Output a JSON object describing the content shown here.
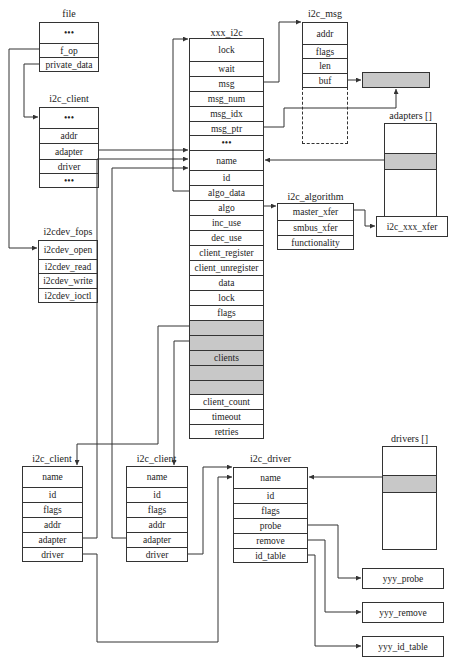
{
  "structs": {
    "file": {
      "title": "file",
      "fields": [
        "•••",
        "f_op",
        "private_data"
      ]
    },
    "i2c_client_top": {
      "title": "i2c_client",
      "fields": [
        "•••",
        "addr",
        "adapter",
        "driver",
        "•••"
      ]
    },
    "i2cdev_fops": {
      "title": "i2cdev_fops",
      "fields": [
        "i2cdev_open",
        "i2cdev_read",
        "i2cdev_write",
        "i2cdev_ioctl"
      ]
    },
    "xxx_i2c": {
      "title": "xxx_i2c",
      "fields": [
        "lock",
        "wait",
        "msg",
        "msg_num",
        "msg_idx",
        "msg_ptr",
        "•••",
        "name",
        "id",
        "algo_data",
        "algo",
        "inc_use",
        "dec_use",
        "client_register",
        "client_unregister",
        "data",
        "lock",
        "flags",
        "",
        "",
        "clients",
        "",
        "",
        "client_count",
        "timeout",
        "retries"
      ]
    },
    "i2c_msg": {
      "title": "i2c_msg",
      "fields": [
        "addr",
        "flags",
        "len",
        "buf"
      ]
    },
    "adapters": {
      "title": "adapters []"
    },
    "i2c_algorithm": {
      "title": "i2c_algorithm",
      "fields": [
        "master_xfer",
        "smbus_xfer",
        "functionality"
      ]
    },
    "i2c_xxx_xfer": {
      "label": "i2c_xxx_xfer"
    },
    "i2c_client_1": {
      "title": "i2c_client",
      "fields": [
        "name",
        "id",
        "flags",
        "addr",
        "adapter",
        "driver"
      ]
    },
    "i2c_client_2": {
      "title": "i2c_client",
      "fields": [
        "name",
        "id",
        "flags",
        "addr",
        "adapter",
        "driver"
      ]
    },
    "i2c_driver": {
      "title": "i2c_driver",
      "fields": [
        "name",
        "id",
        "flags",
        "probe",
        "remove",
        "id_table"
      ]
    },
    "drivers": {
      "title": "drivers []"
    },
    "yyy_probe": {
      "label": "yyy_probe"
    },
    "yyy_remove": {
      "label": "yyy_remove"
    },
    "yyy_id_table": {
      "label": "yyy_id_table"
    }
  },
  "colors": {
    "line": "#333333",
    "highlight": "#c8c8c8"
  }
}
